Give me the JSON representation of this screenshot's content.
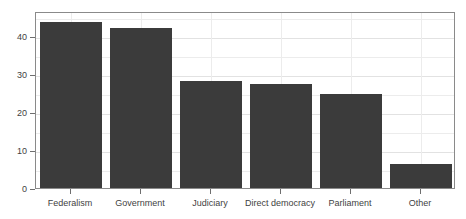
{
  "chart_data": {
    "type": "bar",
    "title": "",
    "subtitle": "",
    "xlabel": "",
    "ylabel": "",
    "categories": [
      "Federalism",
      "Government",
      "Judiciary",
      "Direct democracy",
      "Parliament",
      "Other"
    ],
    "values": [
      43.5,
      42.0,
      28.0,
      27.3,
      24.8,
      6.2
    ],
    "ylim": [
      0,
      46.5
    ],
    "yticks": [
      0,
      10,
      20,
      30,
      40
    ],
    "ytick_labels": [
      "0",
      "10",
      "20",
      "30",
      "40"
    ],
    "minor_yticks": [
      5,
      15,
      25,
      35,
      45
    ],
    "grid": "horizontal-and-vertical",
    "legend": "none",
    "bar_color": "#3b3b3b",
    "grid_color": "#ececec",
    "panel_border_color": "#8a8a8a",
    "background_color": "#ffffff"
  }
}
